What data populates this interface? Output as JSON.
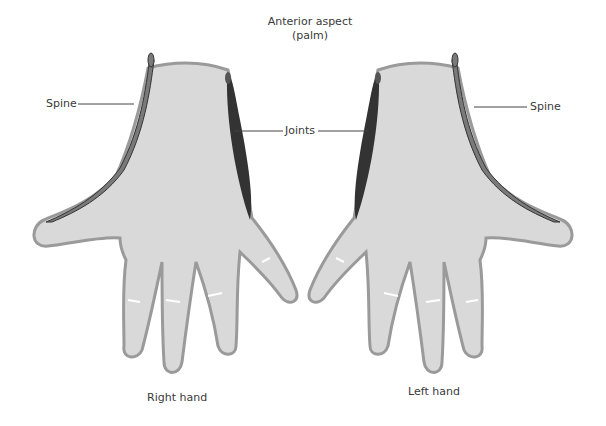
{
  "title": {
    "line1": "Anterior aspect",
    "line2": "(palm)"
  },
  "labels": {
    "spine_left": "Spine",
    "joints": "Joints",
    "spine_right": "Spine",
    "right_hand": "Right hand",
    "left_hand": "Left hand"
  },
  "colors": {
    "skin": "#d9d9d9",
    "outline": "#9a9a9a",
    "spine": "#7a7a7a",
    "joints": "#333333",
    "leader_line": "#444444"
  }
}
